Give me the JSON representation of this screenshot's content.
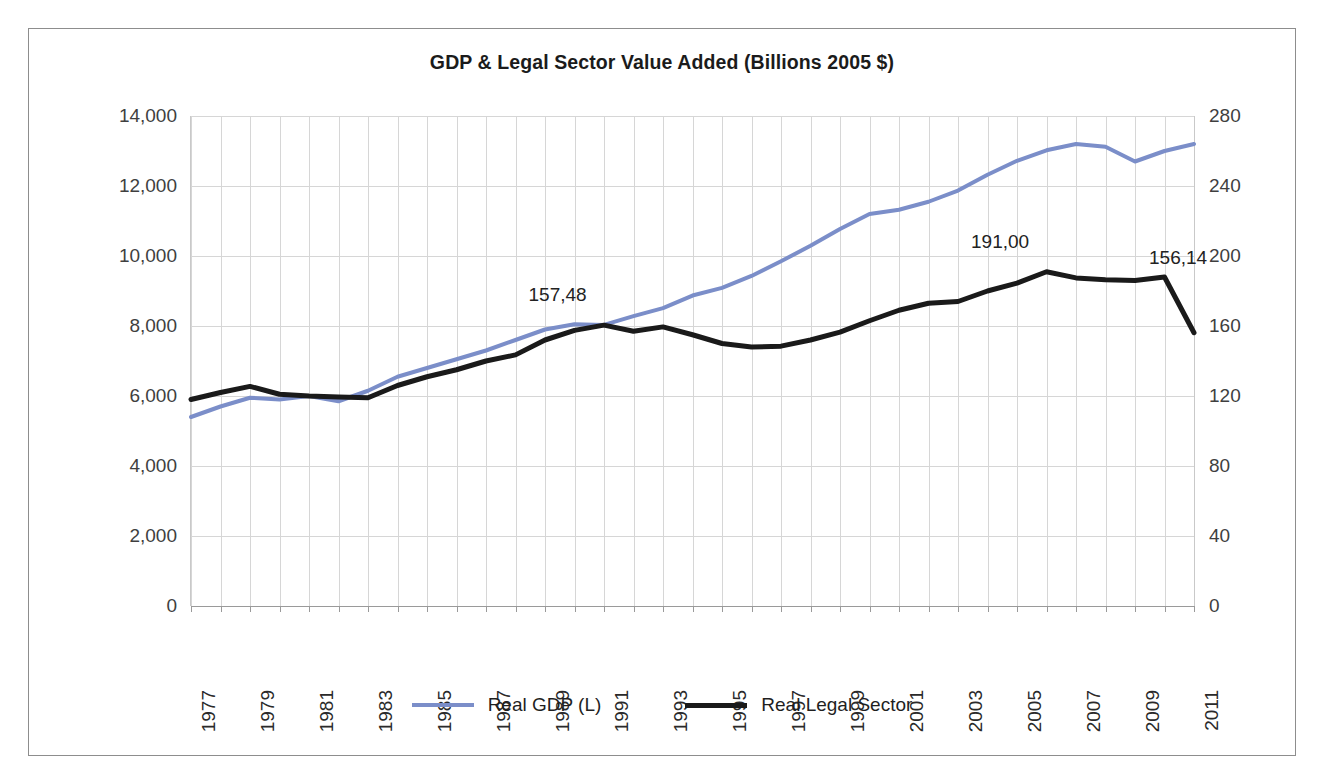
{
  "chart_data": {
    "type": "line",
    "title": "GDP & Legal Sector Value Added (Billions 2005 $)",
    "xlabel": "",
    "ylabel": "",
    "grid": true,
    "legend_position": "bottom",
    "x": [
      1977,
      1978,
      1979,
      1980,
      1981,
      1982,
      1983,
      1984,
      1985,
      1986,
      1987,
      1988,
      1989,
      1990,
      1991,
      1992,
      1993,
      1994,
      1995,
      1996,
      1997,
      1998,
      1999,
      2000,
      2001,
      2002,
      2003,
      2004,
      2005,
      2006,
      2007,
      2008,
      2009,
      2010,
      2011
    ],
    "categories": [
      "1977",
      "1978",
      "1979",
      "1980",
      "1981",
      "1982",
      "1983",
      "1984",
      "1985",
      "1986",
      "1987",
      "1988",
      "1989",
      "1990",
      "1991",
      "1992",
      "1993",
      "1994",
      "1995",
      "1996",
      "1997",
      "1998",
      "1999",
      "2000",
      "2001",
      "2002",
      "2003",
      "2004",
      "2005",
      "2006",
      "2007",
      "2008",
      "2009",
      "2010",
      "2011"
    ],
    "xtick_labels": [
      "1977",
      "1979",
      "1981",
      "1983",
      "1985",
      "1987",
      "1989",
      "1991",
      "1993",
      "1995",
      "1997",
      "1999",
      "2001",
      "2003",
      "2005",
      "2007",
      "2009",
      "2011"
    ],
    "axes": [
      {
        "id": "left",
        "name": "Real GDP (L)",
        "ylim": [
          0,
          14000
        ],
        "yticks": [
          0,
          2000,
          4000,
          6000,
          8000,
          10000,
          12000,
          14000
        ],
        "ytick_labels": [
          "0",
          "2,000",
          "4,000",
          "6,000",
          "8,000",
          "10,000",
          "12,000",
          "14,000"
        ]
      },
      {
        "id": "right",
        "name": "Real Legal Sector",
        "ylim": [
          0,
          280
        ],
        "yticks": [
          0,
          40,
          80,
          120,
          160,
          200,
          240,
          280
        ],
        "ytick_labels": [
          "0",
          "40",
          "80",
          "120",
          "160",
          "200",
          "240",
          "280"
        ]
      }
    ],
    "series": [
      {
        "name": "Real GDP (L)",
        "axis": "left",
        "color": "#7b8ec9",
        "width": 4,
        "values": [
          5400,
          5700,
          5950,
          5900,
          6000,
          5850,
          6150,
          6550,
          6800,
          7050,
          7300,
          7600,
          7900,
          8050,
          8030,
          8280,
          8510,
          8870,
          9090,
          9430,
          9850,
          10290,
          10770,
          11200,
          11320,
          11550,
          11870,
          12320,
          12720,
          13020,
          13200,
          13120,
          12700,
          13000,
          13200
        ]
      },
      {
        "name": "Real Legal Sector",
        "axis": "right",
        "color": "#1a1a1a",
        "width": 5,
        "values": [
          118.0,
          122.0,
          125.5,
          121.0,
          120.0,
          119.5,
          119.0,
          126.0,
          131.0,
          135.0,
          140.0,
          143.5,
          152.0,
          157.48,
          160.5,
          157.0,
          159.5,
          155.0,
          150.0,
          148.0,
          148.5,
          152.0,
          156.5,
          163.0,
          169.0,
          173.0,
          174.0,
          180.0,
          184.5,
          191.0,
          187.5,
          186.5,
          186.0,
          188.0,
          156.14
        ]
      }
    ],
    "annotations": [
      {
        "label": "157,48",
        "x": 1990,
        "series": "Real Legal Sector",
        "value": 157.48
      },
      {
        "label": "191,00",
        "x": 2005,
        "series": "Real Legal Sector",
        "value": 191.0
      },
      {
        "label": "156,14",
        "x": 2009,
        "series": "Real Legal Sector",
        "value": 156.14
      }
    ]
  },
  "legend": {
    "items": [
      {
        "label": "Real GDP (L)",
        "color": "#7b8ec9"
      },
      {
        "label": "Real Legal Sector",
        "color": "#1a1a1a"
      }
    ]
  },
  "colors": {
    "gdp_line": "#7b8ec9",
    "legal_line": "#1a1a1a",
    "gridline": "#d6d6d6",
    "border": "#8d8d8d",
    "background": "#ffffff"
  }
}
